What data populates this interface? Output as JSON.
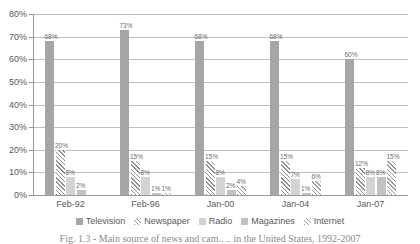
{
  "chart_data": {
    "type": "bar",
    "title": "",
    "xlabel": "",
    "ylabel": "",
    "ylim": [
      0,
      80
    ],
    "grid": true,
    "legend_position": "bottom",
    "categories": [
      "Feb-92",
      "Feb-96",
      "Jan-00",
      "Jan-04",
      "Jan-07"
    ],
    "ytick_labels": [
      "0%",
      "10%",
      "20%",
      "30%",
      "40%",
      "50%",
      "60%",
      "70%",
      "80%"
    ],
    "ytick_values": [
      0,
      10,
      20,
      30,
      40,
      50,
      60,
      70,
      80
    ],
    "series": [
      {
        "name": "Television",
        "color": "#a6a6a6",
        "pattern": "solid",
        "values": [
          68,
          73,
          68,
          68,
          60
        ],
        "labels": [
          "68%",
          "73%",
          "68%",
          "68%",
          "60%"
        ]
      },
      {
        "name": "Newspaper",
        "color": "#8f8f8f",
        "pattern": "diagonal-hatch",
        "values": [
          20,
          15,
          15,
          15,
          12
        ],
        "labels": [
          "20%",
          "15%",
          "15%",
          "15%",
          "12%"
        ]
      },
      {
        "name": "Radio",
        "color": "#d4d4d4",
        "pattern": "solid",
        "values": [
          8,
          8,
          8,
          7,
          8
        ],
        "labels": [
          "8%",
          "8%",
          "8%",
          "7%",
          "8%"
        ]
      },
      {
        "name": "Magazines",
        "color": "#c2c2c2",
        "pattern": "solid",
        "values": [
          2,
          1,
          2,
          1,
          8
        ],
        "labels": [
          "2%",
          "1%",
          "2%",
          "1%",
          "8%"
        ]
      },
      {
        "name": "Internet",
        "color": "#9d9d9d",
        "pattern": "diagonal-hatch",
        "values": [
          0,
          1,
          4,
          6,
          15
        ],
        "labels": [
          "",
          "1%",
          "4%",
          "6%",
          "15%"
        ]
      }
    ]
  },
  "caption": "Fig. 1.3 - Main source of news and cam.. .. in the United States, 1992-2007"
}
